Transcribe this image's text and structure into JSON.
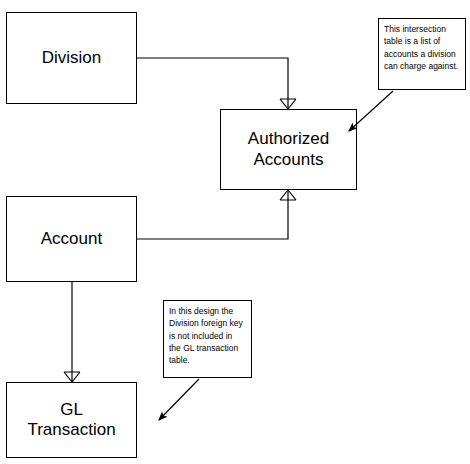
{
  "diagram": {
    "entities": [
      {
        "id": "division",
        "label": "Division",
        "x": 6,
        "y": 12,
        "w": 131,
        "h": 92
      },
      {
        "id": "authorized-accounts",
        "label": "Authorized\nAccounts",
        "label_line1": "Authorized",
        "label_line2": "Accounts",
        "x": 220,
        "y": 109,
        "w": 137,
        "h": 81
      },
      {
        "id": "account",
        "label": "Account",
        "x": 6,
        "y": 196,
        "w": 131,
        "h": 86
      },
      {
        "id": "gl-transaction",
        "label": "GL\nTransaction",
        "label_line1": "GL",
        "label_line2": "Transaction",
        "x": 6,
        "y": 382,
        "w": 131,
        "h": 76
      }
    ],
    "notes": [
      {
        "id": "note-intersection",
        "text": "This intersection table is a list of accounts a division can charge against.",
        "x": 378,
        "y": 18,
        "w": 88,
        "h": 72
      },
      {
        "id": "note-foreign-key",
        "text": "In this design the Division foreign key is not included in the GL transaction table.",
        "x": 163,
        "y": 300,
        "w": 89,
        "h": 78
      }
    ],
    "relationships": [
      {
        "id": "division-to-authorized-accounts",
        "from": "division",
        "to": "authorized-accounts",
        "crow_foot_at": "authorized-accounts-top"
      },
      {
        "id": "account-to-authorized-accounts",
        "from": "account",
        "to": "authorized-accounts",
        "crow_foot_at": "authorized-accounts-bottom"
      },
      {
        "id": "account-to-gl-transaction",
        "from": "account",
        "to": "gl-transaction",
        "crow_foot_at": "gl-transaction-top"
      }
    ],
    "note_arrows": [
      {
        "id": "arrow-intersection",
        "from_note": "note-intersection",
        "points": "392,90 348,131",
        "head_at": "348,131"
      },
      {
        "id": "arrow-foreign-key",
        "from_note": "note-foreign-key",
        "points": "198,378 158,420",
        "head_at": "158,420"
      }
    ],
    "colors": {
      "line": "#000000",
      "box_fill": "#ffffff",
      "text": "#000000",
      "background": "#ffffff"
    }
  }
}
